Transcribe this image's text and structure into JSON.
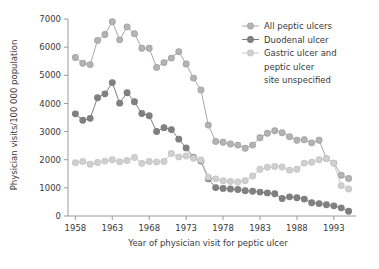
{
  "chart_data": {
    "type": "line",
    "title": "",
    "xlabel": "Year of physician visit for peptic ulcer",
    "ylabel": "Physician visits/100 000 population",
    "xlim": [
      1957,
      1996
    ],
    "ylim": [
      0,
      7000
    ],
    "xticks": [
      1958,
      1963,
      1968,
      1973,
      1978,
      1983,
      1988,
      1993
    ],
    "yticks": [
      0,
      1000,
      2000,
      3000,
      4000,
      5000,
      6000,
      7000
    ],
    "grid": false,
    "legend_position": "top-right",
    "x": [
      1958,
      1959,
      1960,
      1961,
      1962,
      1963,
      1964,
      1965,
      1966,
      1967,
      1968,
      1969,
      1970,
      1971,
      1972,
      1973,
      1974,
      1975,
      1976,
      1977,
      1978,
      1979,
      1980,
      1981,
      1982,
      1983,
      1984,
      1985,
      1986,
      1987,
      1988,
      1989,
      1990,
      1991,
      1992,
      1993,
      1994,
      1995
    ],
    "series": [
      {
        "name": "All peptic ulcers",
        "color": "#a8a8a8",
        "marker_fill": "#b4b4b4",
        "values": [
          5630,
          5430,
          5380,
          6240,
          6450,
          6900,
          6260,
          6720,
          6480,
          5960,
          5960,
          5280,
          5450,
          5610,
          5840,
          5400,
          4900,
          4480,
          3230,
          2650,
          2620,
          2560,
          2520,
          2410,
          2520,
          2780,
          2940,
          3030,
          2960,
          2820,
          2690,
          2710,
          2600,
          2690,
          2040,
          1880,
          1450,
          1330
        ]
      },
      {
        "name": "Duodenal ulcer",
        "color": "#7f7f7f",
        "marker_fill": "#808080",
        "values": [
          3630,
          3400,
          3470,
          4200,
          4340,
          4740,
          4010,
          4380,
          4060,
          3640,
          3560,
          3000,
          3140,
          3070,
          2730,
          2420,
          2080,
          1950,
          1320,
          1010,
          980,
          960,
          940,
          900,
          880,
          850,
          820,
          790,
          620,
          680,
          650,
          600,
          470,
          440,
          400,
          360,
          290,
          170
        ]
      },
      {
        "name": "Gastric ulcer and peptic ulcer site unspecified",
        "color": "#c8c8c8",
        "marker_fill": "#d0d0d0",
        "values": [
          1890,
          1940,
          1840,
          1900,
          1950,
          2000,
          1930,
          1970,
          2080,
          1870,
          1940,
          1920,
          1940,
          2220,
          2100,
          2130,
          2050,
          1990,
          1380,
          1320,
          1250,
          1230,
          1210,
          1250,
          1420,
          1660,
          1730,
          1760,
          1740,
          1630,
          1660,
          1880,
          1910,
          2000,
          2040,
          1880,
          1080,
          960
        ]
      }
    ]
  },
  "legend": {
    "items": [
      {
        "label": "All peptic ulcers"
      },
      {
        "label": "Duodenal ulcer"
      },
      {
        "label": "Gastric ulcer and"
      },
      {
        "label": "peptic ulcer"
      },
      {
        "label": "site unspecified"
      }
    ]
  }
}
